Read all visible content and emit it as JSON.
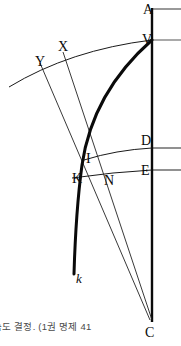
{
  "figure": {
    "labels": [
      {
        "name": "A",
        "text": "A",
        "x": 143,
        "y": 3,
        "italic": false
      },
      {
        "name": "V",
        "text": "V",
        "x": 142,
        "y": 33,
        "italic": false
      },
      {
        "name": "X",
        "text": "X",
        "x": 58,
        "y": 40,
        "italic": false
      },
      {
        "name": "Y",
        "text": "Y",
        "x": 35,
        "y": 55,
        "italic": false
      },
      {
        "name": "D",
        "text": "D",
        "x": 141,
        "y": 134,
        "italic": false
      },
      {
        "name": "I",
        "text": "I",
        "x": 86,
        "y": 152,
        "italic": false
      },
      {
        "name": "E",
        "text": "E",
        "x": 141,
        "y": 164,
        "italic": false
      },
      {
        "name": "K",
        "text": "K",
        "x": 72,
        "y": 172,
        "italic": false
      },
      {
        "name": "N",
        "text": "N",
        "x": 104,
        "y": 174,
        "italic": false
      },
      {
        "name": "k",
        "text": "k",
        "x": 76,
        "y": 272,
        "italic": true
      },
      {
        "name": "C",
        "text": "C",
        "x": 145,
        "y": 326,
        "italic": false
      }
    ],
    "caption": "속도 결정. (1권 명제 41",
    "colors": {
      "ink": "#0a0a0a",
      "thin_line": "#222222",
      "horizontal_ray": "#555555",
      "caption": "#4a4a4a",
      "background": "#ffffff"
    },
    "strokes": {
      "axis_width": 2.4,
      "thick_curve_width": 3.0,
      "arc_width": 1.0,
      "thin_line_width": 0.9,
      "ray_width": 1.2
    },
    "geometry": {
      "axis_vertical": {
        "x": 152,
        "y_top": 8,
        "y_bottom": 322
      },
      "ray_at_A": {
        "x1": 152,
        "y1": 9,
        "x2": 181,
        "y2": 9
      },
      "ray_at_V": {
        "x1": 0,
        "y1": 40,
        "x2": 181,
        "y2": 40
      },
      "ray_at_D": {
        "x1": 152,
        "y1": 148,
        "x2": 181,
        "y2": 148
      },
      "ray_at_E": {
        "x1": 152,
        "y1": 170,
        "x2": 181,
        "y2": 170
      },
      "arc_top_VXY": "M 9,87 Q 70,50 152,40",
      "arc_D": "M 84,160 Q 116,150 152,148",
      "arc_E": "M 72,178 Q 116,172 152,170",
      "curve_thick_VkC": "M 152,40 C 118,70 88,112 80,170 C 76,205 75,240 74,274",
      "line_X_to_C": "M 63,52 L 152,320",
      "line_Y_to_C": "M 40,63 L 151,320"
    }
  }
}
